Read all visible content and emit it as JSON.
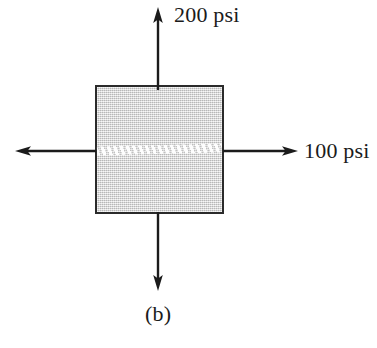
{
  "figure": {
    "caption": "(b)",
    "background_color": "#ffffff",
    "line_color": "#1b1b1b",
    "text_color": "#1b1b1b"
  },
  "element": {
    "name": "stress-element",
    "shape": "square",
    "fill_color": "#d9d9d9",
    "border_color": "#2b2b2b",
    "left": 95,
    "top": 85,
    "width": 129,
    "height": 129
  },
  "loads": [
    {
      "id": "vertical-tension",
      "label": "200 psi",
      "magnitude": 200,
      "unit": "psi",
      "direction": "vertical",
      "sense": "tension",
      "arrows": [
        "up",
        "down"
      ]
    },
    {
      "id": "horizontal-tension",
      "label": "100 psi",
      "magnitude": 100,
      "unit": "psi",
      "direction": "horizontal",
      "sense": "tension",
      "arrows": [
        "left",
        "right"
      ]
    }
  ],
  "arrows": {
    "up": {
      "icon": "arrow-up-icon",
      "from": [
        158,
        85
      ],
      "to": [
        158,
        10
      ]
    },
    "down": {
      "icon": "arrow-down-icon",
      "from": [
        158,
        214
      ],
      "to": [
        158,
        291
      ]
    },
    "left": {
      "icon": "arrow-left-icon",
      "from": [
        95,
        151
      ],
      "to": [
        16,
        151
      ]
    },
    "right": {
      "icon": "arrow-right-icon",
      "from": [
        224,
        151
      ],
      "to": [
        297,
        151
      ]
    }
  }
}
